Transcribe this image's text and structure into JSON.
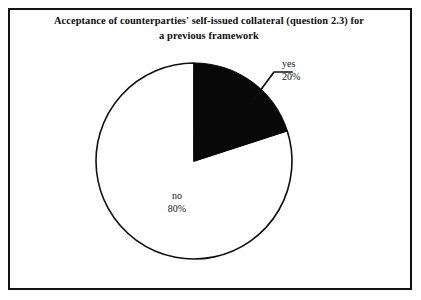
{
  "chart_data": {
    "type": "pie",
    "title": "Acceptance of counterparties' self-issued collateral (question 2.3) for a previous framework",
    "title_lines": [
      "Acceptance of counterparties' self-issued collateral (question 2.3) for",
      "a previous framework"
    ],
    "categories": [
      "yes",
      "no"
    ],
    "values": [
      20,
      80
    ],
    "value_labels": [
      "20%",
      "80%"
    ],
    "slices": [
      {
        "name": "yes",
        "value": 20,
        "value_label": "20%",
        "color": "#000000",
        "start_angle_deg": 0,
        "end_angle_deg": 72,
        "label_position": "outside",
        "has_leader_line": true
      },
      {
        "name": "no",
        "value": 80,
        "value_label": "80%",
        "color": "#ffffff",
        "start_angle_deg": 72,
        "end_angle_deg": 360,
        "label_position": "inside",
        "has_leader_line": false
      }
    ],
    "units": "percent",
    "start_angle": "12 o'clock",
    "direction": "clockwise",
    "legend": false,
    "grid": false,
    "xlabel": "",
    "ylabel": "",
    "outline_color": "#101010",
    "border_color": "#131313",
    "background": "#ffffff"
  },
  "chart": {
    "title_line_1": "Acceptance of counterparties' self-issued collateral (question 2.3) for",
    "title_line_2": "a previous framework",
    "labels": {
      "yes_name": "yes",
      "yes_value": "20%",
      "no_name": "no",
      "no_value": "80%"
    }
  }
}
